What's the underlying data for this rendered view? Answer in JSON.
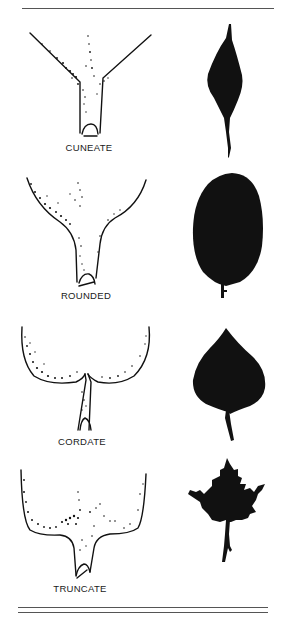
{
  "figure": {
    "type": "leaf-base-shapes-diagram",
    "colors": {
      "ink": "#111111",
      "rule": "#555555",
      "background": "#ffffff"
    },
    "panels": [
      {
        "label": "CUNEATE",
        "base_shape": "wedge-shaped, tapering to petiole",
        "leaf_silhouette": "lanceolate-acuminate"
      },
      {
        "label": "ROUNDED",
        "base_shape": "rounded into petiole",
        "leaf_silhouette": "oval"
      },
      {
        "label": "CORDATE",
        "base_shape": "heart-shaped notch at petiole",
        "leaf_silhouette": "heart-shaped"
      },
      {
        "label": "TRUNCATE",
        "base_shape": "squared-off base",
        "leaf_silhouette": "maple-like lobed"
      }
    ]
  }
}
